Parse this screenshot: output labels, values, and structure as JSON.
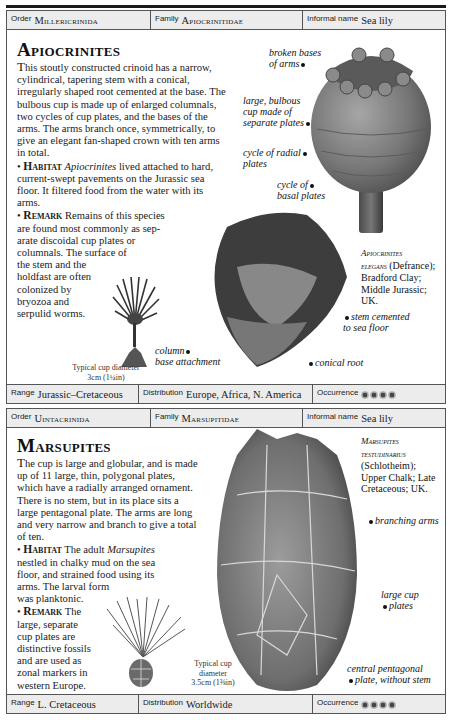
{
  "entries": [
    {
      "header": {
        "order_label": "Order",
        "order_value": "Millericrinida",
        "family_label": "Family",
        "family_value": "Apiocrinitidae",
        "informal_label": "Informal name",
        "informal_value": "Sea lily"
      },
      "title": "Apiocrinites",
      "description": "his stoutly constructed crinoid has a narrow, cylindrical, tapering stem with a conical, irregularly shaped root cemented at the base. The bulbous cup is made up of enlarged columnals, two cycles of cup plates, and the bases of the arms. The arms branch once, symmetrically, to give an elegant fan-shaped crown with ten arms in total.",
      "description_dropcap": "T",
      "habitat_keyword": "Habitat",
      "habitat_genus": "Apiocrinites",
      "habitat_text": " lived attached to hard, current-swept pavements on the Jurassic sea floor. It filtered food from the water with its arms.",
      "remark_keyword": "Remark",
      "remark_lines": [
        "Remains of this species",
        "are found most commonly as sep-",
        "arate discoidal cup plates or",
        "columnals. The surface of",
        "the stem and the",
        "holdfast are often",
        "colonized by",
        "bryozoa and",
        "serpulid worms."
      ],
      "scale_note": [
        "Typical cup diameter",
        "3cm (1¼in)"
      ],
      "labels": {
        "broken_bases": [
          "broken bases",
          "of arms"
        ],
        "bulbous_cup": [
          "large, bulbous",
          "cup made of",
          "separate plates"
        ],
        "radial_plates": [
          "cycle of radial",
          "plates"
        ],
        "basal_plates": [
          "cycle of",
          "basal plates"
        ],
        "stem_cemented": [
          "stem cemented",
          "to sea floor"
        ],
        "conical_root": "conical root",
        "column_base": [
          "column",
          "base attachment"
        ]
      },
      "caption": {
        "species_line1": "Apiocrinites",
        "species_line2": "elegans",
        "author": " (Defrance);",
        "formation": "Bradford Clay;",
        "age": "Middle Jurassic; UK."
      },
      "footer": {
        "range_label": "Range",
        "range_value": "Jurassic–Cretaceous",
        "distribution_label": "Distribution",
        "distribution_value": "Europe, Africa, N. America",
        "occurrence_label": "Occurrence",
        "occurrence_count": 4
      }
    },
    {
      "header": {
        "order_label": "Order",
        "order_value": "Uintacrinida",
        "family_label": "Family",
        "family_value": "Marsupitidae",
        "informal_label": "Informal name",
        "informal_value": "Sea lily"
      },
      "title": "Marsupites",
      "description": "he cup is large and globular, and is made up of 11 large, thin, polygonal plates, which have a radially arranged ornament. There is no stem, but in its place sits a large pentagonal plate. The arms are long and very narrow and branch to give a total of ten.",
      "description_dropcap": "T",
      "habitat_keyword": "Habitat",
      "habitat_pre": " The adult ",
      "habitat_genus": "Marsupites",
      "habitat_lines": [
        "nestled in chalky mud on the sea",
        "floor, and strained food using its",
        "arms. The larval form",
        "was planktonic."
      ],
      "remark_keyword": "Remark",
      "remark_first": " The",
      "remark_lines": [
        "large, separate",
        "cup plates are",
        "distinctive fossils",
        "and are used as",
        "zonal markers in",
        "western Europe."
      ],
      "scale_note": [
        "Typical cup",
        "diameter",
        "3.5cm (1⅜in)"
      ],
      "labels": {
        "branching_arms": "branching arms",
        "large_cup_plates": [
          "large cup",
          "plates"
        ],
        "central_plate": [
          "central pentagonal",
          "plate, without stem"
        ]
      },
      "caption": {
        "species_line1": "Marsupites",
        "species_line2": "testudinarius",
        "author": "(Schlotheim);",
        "formation": "Upper Chalk; Late",
        "age": "Cretaceous; UK."
      },
      "footer": {
        "range_label": "Range",
        "range_value": "L. Cretaceous",
        "distribution_label": "Distribution",
        "distribution_value": "Worldwide",
        "occurrence_label": "Occurrence",
        "occurrence_count": 4
      }
    }
  ]
}
